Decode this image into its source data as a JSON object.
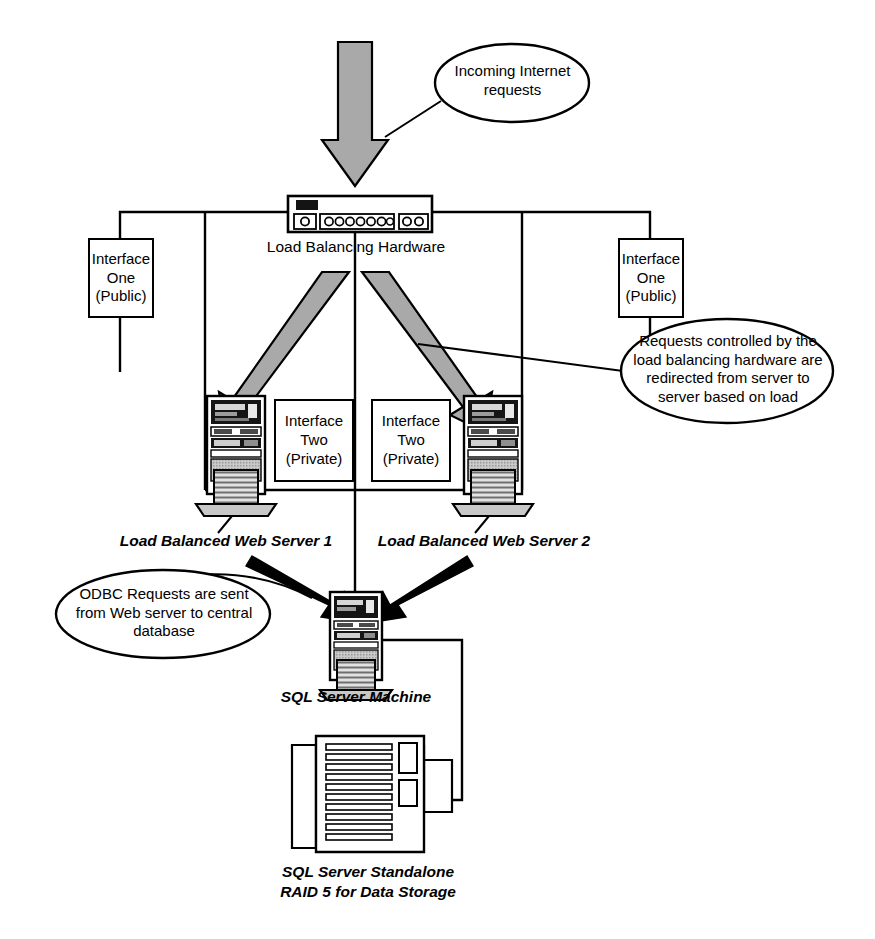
{
  "diagram": {
    "background_color": "#ffffff",
    "line_color": "#000000",
    "arrow_fill_color": "#a8a8a8",
    "device_dark_color": "#1a1a1a"
  },
  "callouts": [
    {
      "id": "incoming",
      "text": "Incoming Internet\nrequests",
      "shape": "ellipse"
    },
    {
      "id": "redirect",
      "text": "Requests controlled by the\nload balancing hardware are\nredirected from server to\nserver based on load",
      "shape": "ellipse"
    },
    {
      "id": "odbc",
      "text": "ODBC Requests are sent\nfrom Web server to central\ndatabase",
      "shape": "ellipse"
    }
  ],
  "interface_boxes": [
    {
      "id": "iface-one-left",
      "text": "Interface\nOne\n(Public)"
    },
    {
      "id": "iface-one-right",
      "text": "Interface\nOne\n(Public)"
    },
    {
      "id": "iface-two-left",
      "text": "Interface\nTwo\n(Private)"
    },
    {
      "id": "iface-two-right",
      "text": "Interface\nTwo\n(Private)"
    }
  ],
  "nodes": {
    "load_balancer": {
      "label": "Load Balancing Hardware",
      "port_groups": [
        1,
        7,
        2
      ]
    },
    "web_server_1": {
      "label": "Load Balanced Web Server 1"
    },
    "web_server_2": {
      "label": "Load Balanced Web Server 2"
    },
    "sql_server": {
      "label": "SQL Server Machine"
    },
    "raid_array": {
      "label": "SQL Server Standalone\nRAID 5 for Data Storage"
    }
  },
  "icons": {
    "incoming_arrow": "down-arrow-icon",
    "distribute_arrow_left": "diagonal-arrow-down-left-icon",
    "distribute_arrow_right": "diagonal-arrow-down-right-icon",
    "odbc_arrow_left": "odbc-arrow-left-icon",
    "odbc_arrow_right": "odbc-arrow-right-icon",
    "load_balancer_icon": "network-appliance-icon",
    "server_tower_icon": "server-tower-icon",
    "raid_icon": "raid-storage-icon"
  }
}
